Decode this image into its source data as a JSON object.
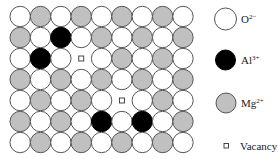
{
  "diagram": {
    "type": "crystal-lattice-defect-diagram",
    "grid": {
      "rows": 7,
      "cols": 9,
      "legend_keys": {
        "O": "O2-",
        "A": "Al3+",
        "M": "Mg2+",
        "V": "Vacancy"
      },
      "cells": [
        [
          "O",
          "M",
          "O",
          "M",
          "O",
          "M",
          "O",
          "M",
          "O"
        ],
        [
          "M",
          "O",
          "A",
          "O",
          "M",
          "O",
          "M",
          "O",
          "M"
        ],
        [
          "O",
          "A",
          "O",
          "V",
          "O",
          "M",
          "O",
          "M",
          "O"
        ],
        [
          "M",
          "O",
          "M",
          "O",
          "M",
          "O",
          "M",
          "O",
          "M"
        ],
        [
          "O",
          "M",
          "O",
          "M",
          "O",
          "V",
          "O",
          "M",
          "O"
        ],
        [
          "M",
          "O",
          "M",
          "O",
          "A",
          "O",
          "A",
          "O",
          "M"
        ],
        [
          "O",
          "M",
          "O",
          "M",
          "O",
          "M",
          "O",
          "M",
          "O"
        ]
      ]
    },
    "colors": {
      "O": "#ffffff",
      "A": "#000000",
      "M": "#c0c0c0",
      "outline": "#555555"
    }
  },
  "legend": {
    "items": [
      {
        "key": "O",
        "symbol": "white-circle",
        "base": "O",
        "charge": "2−"
      },
      {
        "key": "A",
        "symbol": "black-circle",
        "base": "Al",
        "charge": "3+"
      },
      {
        "key": "M",
        "symbol": "grey-circle",
        "base": "Mg",
        "charge": "2+"
      },
      {
        "key": "V",
        "symbol": "small-square",
        "base": "Vacancy",
        "charge": ""
      }
    ]
  }
}
